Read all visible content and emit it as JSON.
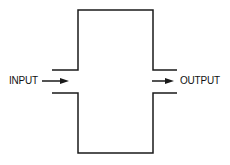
{
  "diagram": {
    "input_label": "INPUT",
    "output_label": "OUTPUT",
    "line_color": "#1a1a1a"
  }
}
